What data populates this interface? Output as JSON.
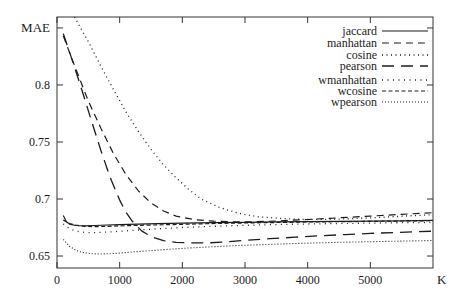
{
  "chart_data": {
    "type": "line",
    "title": "",
    "xlabel": "K",
    "ylabel": "MAE",
    "xlim": [
      0,
      6000
    ],
    "ylim": [
      0.6395,
      0.8596
    ],
    "grid": false,
    "legend_position": "top-right",
    "axis_color": "#333333",
    "line_color": "#1c1c1c",
    "xticks": [
      0,
      1000,
      2000,
      3000,
      4000,
      5000
    ],
    "xtick_labels": [
      "0",
      "1000",
      "2000",
      "3000",
      "4000",
      "5000"
    ],
    "yticks": [
      0.65,
      0.7,
      0.75,
      0.8,
      0.85
    ],
    "ytick_labels": [
      "0.65",
      "0.7",
      "0.75",
      "0.8",
      ""
    ],
    "legend": [
      {
        "label": "jaccard",
        "dash": "",
        "width": 1.2
      },
      {
        "label": "manhattan",
        "dash": "7,5",
        "width": 1.2
      },
      {
        "label": "cosine",
        "dash": "1,3.5",
        "width": 1.3
      },
      {
        "label": "pearson",
        "dash": "12,7",
        "width": 1.3
      },
      {
        "label": "wmanhattan",
        "dash": "1,4.5",
        "width": 1.3
      },
      {
        "label": "wcosine",
        "dash": "4,2.5",
        "width": 1.2
      },
      {
        "label": "wpearson",
        "dash": "1,2",
        "width": 1.1
      }
    ],
    "series": [
      {
        "name": "jaccard",
        "dash": "",
        "width": 1.2,
        "points": [
          [
            100,
            0.6855
          ],
          [
            150,
            0.68
          ],
          [
            200,
            0.678
          ],
          [
            300,
            0.6768
          ],
          [
            450,
            0.6765
          ],
          [
            600,
            0.6768
          ],
          [
            800,
            0.6772
          ],
          [
            1000,
            0.6776
          ],
          [
            1300,
            0.678
          ],
          [
            1600,
            0.6784
          ],
          [
            2000,
            0.6788
          ],
          [
            2500,
            0.6792
          ],
          [
            3000,
            0.6796
          ],
          [
            3500,
            0.6799
          ],
          [
            4000,
            0.6802
          ],
          [
            4500,
            0.6804
          ],
          [
            5000,
            0.6806
          ],
          [
            5500,
            0.6809
          ],
          [
            6000,
            0.6812
          ]
        ]
      },
      {
        "name": "manhattan",
        "dash": "7,5",
        "width": 1.2,
        "points": [
          [
            100,
            0.843
          ],
          [
            300,
            0.814
          ],
          [
            500,
            0.786
          ],
          [
            700,
            0.762
          ],
          [
            900,
            0.74
          ],
          [
            1100,
            0.7215
          ],
          [
            1300,
            0.707
          ],
          [
            1500,
            0.6965
          ],
          [
            1700,
            0.6895
          ],
          [
            1900,
            0.685
          ],
          [
            2200,
            0.6818
          ],
          [
            2500,
            0.6805
          ],
          [
            2800,
            0.68
          ],
          [
            3100,
            0.68
          ],
          [
            3500,
            0.6807
          ],
          [
            4000,
            0.682
          ],
          [
            4500,
            0.6835
          ],
          [
            5000,
            0.685
          ],
          [
            5500,
            0.6866
          ],
          [
            6000,
            0.688
          ]
        ]
      },
      {
        "name": "cosine",
        "dash": "1,3.5",
        "width": 1.3,
        "points": [
          [
            280,
            0.8596
          ],
          [
            500,
            0.838
          ],
          [
            700,
            0.8165
          ],
          [
            900,
            0.796
          ],
          [
            1100,
            0.7765
          ],
          [
            1300,
            0.759
          ],
          [
            1500,
            0.7435
          ],
          [
            1700,
            0.73
          ],
          [
            1900,
            0.7185
          ],
          [
            2100,
            0.7085
          ],
          [
            2300,
            0.7
          ],
          [
            2600,
            0.6925
          ],
          [
            2900,
            0.6875
          ],
          [
            3200,
            0.6845
          ],
          [
            3600,
            0.6828
          ],
          [
            4000,
            0.682
          ],
          [
            4400,
            0.6822
          ],
          [
            4800,
            0.683
          ],
          [
            5200,
            0.684
          ],
          [
            5600,
            0.6852
          ],
          [
            6000,
            0.6862
          ]
        ]
      },
      {
        "name": "pearson",
        "dash": "12,7",
        "width": 1.3,
        "points": [
          [
            100,
            0.845
          ],
          [
            250,
            0.8205
          ],
          [
            400,
            0.795
          ],
          [
            550,
            0.7685
          ],
          [
            700,
            0.7425
          ],
          [
            850,
            0.7185
          ],
          [
            1000,
            0.699
          ],
          [
            1100,
            0.6885
          ],
          [
            1200,
            0.6805
          ],
          [
            1350,
            0.672
          ],
          [
            1500,
            0.667
          ],
          [
            1700,
            0.6635
          ],
          [
            1900,
            0.662
          ],
          [
            2100,
            0.6615
          ],
          [
            2400,
            0.6615
          ],
          [
            2700,
            0.6625
          ],
          [
            3000,
            0.6638
          ],
          [
            3400,
            0.6652
          ],
          [
            3800,
            0.6665
          ],
          [
            4200,
            0.6678
          ],
          [
            4600,
            0.6688
          ],
          [
            5000,
            0.6698
          ],
          [
            5400,
            0.6706
          ],
          [
            6000,
            0.6718
          ]
        ]
      },
      {
        "name": "wmanhattan",
        "dash": "1,4.5",
        "width": 1.3,
        "points": [
          [
            100,
            0.6782
          ],
          [
            200,
            0.674
          ],
          [
            300,
            0.6718
          ],
          [
            450,
            0.6706
          ],
          [
            600,
            0.6705
          ],
          [
            800,
            0.671
          ],
          [
            1000,
            0.6717
          ],
          [
            1300,
            0.6728
          ],
          [
            1600,
            0.6738
          ],
          [
            2000,
            0.675
          ],
          [
            2400,
            0.6759
          ],
          [
            2800,
            0.6766
          ],
          [
            3200,
            0.6772
          ],
          [
            3600,
            0.6777
          ],
          [
            4000,
            0.6781
          ],
          [
            4500,
            0.6785
          ],
          [
            5000,
            0.6789
          ],
          [
            5500,
            0.6792
          ],
          [
            6000,
            0.6795
          ]
        ]
      },
      {
        "name": "wcosine",
        "dash": "4,2.5",
        "width": 1.2,
        "points": [
          [
            100,
            0.6815
          ],
          [
            200,
            0.6785
          ],
          [
            300,
            0.677
          ],
          [
            450,
            0.676
          ],
          [
            600,
            0.6758
          ],
          [
            800,
            0.676
          ],
          [
            1000,
            0.6764
          ],
          [
            1400,
            0.677
          ],
          [
            1800,
            0.6776
          ],
          [
            2200,
            0.6781
          ],
          [
            2600,
            0.6786
          ],
          [
            3000,
            0.679
          ],
          [
            3500,
            0.6794
          ],
          [
            4000,
            0.6798
          ],
          [
            4500,
            0.6801
          ],
          [
            5000,
            0.6804
          ],
          [
            5500,
            0.6807
          ],
          [
            6000,
            0.681
          ]
        ]
      },
      {
        "name": "wpearson",
        "dash": "1,2",
        "width": 1.1,
        "points": [
          [
            100,
            0.6645
          ],
          [
            200,
            0.6585
          ],
          [
            300,
            0.655
          ],
          [
            400,
            0.6532
          ],
          [
            550,
            0.652
          ],
          [
            700,
            0.6518
          ],
          [
            850,
            0.652
          ],
          [
            1000,
            0.6526
          ],
          [
            1200,
            0.6535
          ],
          [
            1500,
            0.6548
          ],
          [
            1800,
            0.656
          ],
          [
            2100,
            0.657
          ],
          [
            2500,
            0.6582
          ],
          [
            2900,
            0.6592
          ],
          [
            3300,
            0.66
          ],
          [
            3700,
            0.6608
          ],
          [
            4100,
            0.6614
          ],
          [
            4500,
            0.662
          ],
          [
            5000,
            0.6626
          ],
          [
            5500,
            0.6631
          ],
          [
            6000,
            0.6636
          ]
        ]
      }
    ]
  }
}
